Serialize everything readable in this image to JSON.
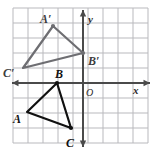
{
  "figure": {
    "background_color": "#ffffff",
    "grid": {
      "line_color": "#b9b9bd",
      "border_color": "#b9b9bd",
      "spacing_px": 15,
      "left_px": 13,
      "top_px": 8,
      "right_px": 148,
      "bottom_px": 143,
      "columns": 9,
      "rows": 9,
      "visible": true
    },
    "axes": {
      "color": "#4a4a4a",
      "origin_px": {
        "x": 83,
        "y": 83
      },
      "x_axis": {
        "label": "x",
        "label_px": {
          "x": 133,
          "y": 85
        },
        "arrow_left": true,
        "arrow_right": true
      },
      "y_axis": {
        "label": "y",
        "label_px": {
          "x": 88,
          "y": 14
        },
        "arrow_up": true,
        "arrow_down": true
      },
      "origin": {
        "label": "O",
        "label_px": {
          "x": 86,
          "y": 88
        }
      }
    },
    "shapes": [
      {
        "name": "triangle-abc",
        "kind": "preimage",
        "stroke": "#111111",
        "stroke_width": 2.2,
        "label_class": "lbl-pre",
        "vertices": [
          {
            "name": "A",
            "label": "A",
            "px": {
              "x": 27,
              "y": 112
            },
            "label_px": {
              "x": 13,
              "y": 113
            },
            "dot": false
          },
          {
            "name": "B",
            "label": "B",
            "px": {
              "x": 57,
              "y": 83
            },
            "label_px": {
              "x": 55,
              "y": 68
            },
            "dot": true
          },
          {
            "name": "C",
            "label": "C",
            "px": {
              "x": 71,
              "y": 128
            },
            "label_px": {
              "x": 66,
              "y": 137
            },
            "dot": true
          }
        ]
      },
      {
        "name": "triangle-a-prime-b-prime-c-prime",
        "kind": "image",
        "stroke": "#6e6e72",
        "stroke_width": 2.2,
        "label_class": "lbl-img",
        "vertices": [
          {
            "name": "A-prime",
            "label": "A′",
            "px": {
              "x": 53,
              "y": 26
            },
            "label_px": {
              "x": 40,
              "y": 13
            },
            "dot": true
          },
          {
            "name": "B-prime",
            "label": "B′",
            "px": {
              "x": 83,
              "y": 53
            },
            "label_px": {
              "x": 88,
              "y": 55
            },
            "dot": true
          },
          {
            "name": "C-prime",
            "label": "C′",
            "px": {
              "x": 23,
              "y": 68
            },
            "label_px": {
              "x": 3,
              "y": 67
            },
            "dot": false
          }
        ]
      }
    ]
  }
}
